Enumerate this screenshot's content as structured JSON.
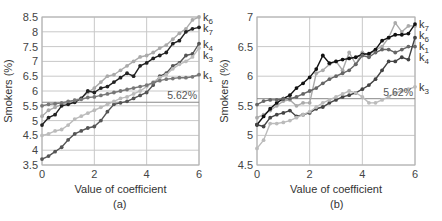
{
  "figure": {
    "panels": [
      {
        "caption": "(a)"
      },
      {
        "caption": "(b)"
      }
    ]
  },
  "chart_data": [
    {
      "type": "line",
      "caption": "(a)",
      "title": "",
      "xlabel": "Value of coefficient",
      "ylabel": "Smokers (%)",
      "xlim": [
        0,
        6
      ],
      "ylim": [
        3.5,
        8.5
      ],
      "xticks": [
        0,
        2,
        4,
        6
      ],
      "yticks": [
        3.5,
        4,
        4.5,
        5,
        5.5,
        6,
        6.5,
        7,
        7.5,
        8,
        8.5
      ],
      "ytick_labels": [
        "3.5",
        "4",
        "4.5",
        "5",
        "5.5",
        "6",
        "6.5",
        "7",
        "7.5",
        "8",
        "8.5"
      ],
      "grid": true,
      "reference_line": {
        "y": 5.62,
        "label": "5.62%"
      },
      "legend_position": "right-end labels",
      "x": [
        0,
        0.25,
        0.5,
        0.75,
        1.0,
        1.25,
        1.5,
        1.75,
        2.0,
        2.25,
        2.5,
        2.75,
        3.0,
        3.25,
        3.5,
        3.75,
        4.0,
        4.25,
        4.5,
        4.75,
        5.0,
        5.25,
        5.5,
        5.75,
        6.0
      ],
      "series": [
        {
          "name": "k6",
          "label_main": "k",
          "label_sub": "6",
          "color": "#aaaaaa",
          "marker_color": "#aaaaaa",
          "values": [
            5.15,
            5.35,
            5.45,
            5.55,
            5.62,
            5.7,
            5.75,
            5.95,
            6.1,
            6.3,
            6.5,
            6.55,
            6.7,
            6.85,
            7.0,
            7.15,
            7.2,
            7.3,
            7.45,
            7.55,
            7.75,
            7.95,
            8.1,
            8.4,
            8.5
          ]
        },
        {
          "name": "k7",
          "label_main": "k",
          "label_sub": "7",
          "color": "#222222",
          "marker_color": "#222222",
          "values": [
            4.85,
            5.1,
            5.2,
            5.5,
            5.55,
            5.62,
            5.75,
            6.0,
            5.95,
            6.1,
            6.15,
            6.3,
            6.45,
            6.6,
            6.5,
            6.85,
            6.95,
            7.1,
            7.2,
            7.3,
            7.6,
            7.7,
            8.0,
            8.1,
            8.15
          ]
        },
        {
          "name": "k4",
          "label_main": "k",
          "label_sub": "4",
          "color": "#555555",
          "marker_color": "#555555",
          "values": [
            3.7,
            3.8,
            3.95,
            4.1,
            4.35,
            4.55,
            4.65,
            4.75,
            4.8,
            5.0,
            5.3,
            5.55,
            5.6,
            5.65,
            5.75,
            5.85,
            5.95,
            6.2,
            6.5,
            6.6,
            6.85,
            6.95,
            7.2,
            7.25,
            7.6
          ]
        },
        {
          "name": "k3",
          "label_main": "k",
          "label_sub": "3",
          "color": "#bbbbbb",
          "marker_color": "#bbbbbb",
          "values": [
            4.5,
            4.55,
            4.65,
            4.7,
            4.85,
            5.05,
            5.15,
            5.25,
            5.35,
            5.45,
            5.55,
            5.65,
            5.75,
            5.8,
            5.9,
            6.0,
            6.15,
            6.3,
            6.45,
            6.55,
            6.75,
            6.9,
            7.0,
            7.15,
            7.45
          ]
        },
        {
          "name": "k1",
          "label_main": "k",
          "label_sub": "1",
          "color": "#777777",
          "marker_color": "#777777",
          "values": [
            5.5,
            5.55,
            5.57,
            5.6,
            5.65,
            5.68,
            5.72,
            5.78,
            5.8,
            5.85,
            5.9,
            5.95,
            6.0,
            6.05,
            6.1,
            6.15,
            6.2,
            6.28,
            6.35,
            6.4,
            6.42,
            6.45,
            6.45,
            6.48,
            6.55
          ]
        }
      ]
    },
    {
      "type": "line",
      "caption": "(b)",
      "title": "",
      "xlabel": "Value of coefficient",
      "ylabel": "Smokers (%)",
      "xlim": [
        0,
        6
      ],
      "ylim": [
        4.5,
        7
      ],
      "xticks": [
        0,
        2,
        4,
        6
      ],
      "yticks": [
        4.5,
        5,
        5.5,
        6,
        6.5,
        7
      ],
      "ytick_labels": [
        "4.5",
        "5",
        "5.5",
        "6",
        "6.5",
        "7"
      ],
      "grid": true,
      "reference_line": {
        "y": 5.62,
        "label": "5.62%"
      },
      "legend_position": "right-end labels",
      "x": [
        0,
        0.25,
        0.5,
        0.75,
        1.0,
        1.25,
        1.5,
        1.75,
        2.0,
        2.25,
        2.5,
        2.75,
        3.0,
        3.25,
        3.5,
        3.75,
        4.0,
        4.25,
        4.5,
        4.75,
        5.0,
        5.25,
        5.5,
        5.75,
        6.0
      ],
      "series": [
        {
          "name": "k6",
          "label_main": "k",
          "label_sub": "6",
          "color": "#aaaaaa",
          "marker_color": "#aaaaaa",
          "values": [
            5.3,
            5.35,
            5.42,
            5.5,
            5.58,
            5.6,
            5.5,
            5.55,
            5.55,
            6.05,
            6.1,
            6.2,
            6.25,
            6.1,
            6.4,
            6.2,
            6.4,
            6.35,
            6.45,
            6.5,
            6.65,
            6.9,
            6.75,
            6.85,
            6.85
          ]
        },
        {
          "name": "k7",
          "label_main": "k",
          "label_sub": "7",
          "color": "#111111",
          "marker_color": "#111111",
          "values": [
            5.18,
            5.32,
            5.45,
            5.55,
            5.62,
            5.68,
            5.8,
            5.88,
            5.98,
            6.12,
            6.35,
            6.22,
            6.25,
            6.28,
            6.3,
            6.32,
            6.37,
            6.38,
            6.45,
            6.6,
            6.65,
            6.7,
            6.7,
            6.72,
            6.88
          ]
        },
        {
          "name": "k4",
          "label_main": "k",
          "label_sub": "4",
          "color": "#666666",
          "marker_color": "#666666",
          "values": [
            5.52,
            5.58,
            5.6,
            5.6,
            5.62,
            5.62,
            5.65,
            5.7,
            5.75,
            5.8,
            5.88,
            5.95,
            6.0,
            6.05,
            6.1,
            6.2,
            6.35,
            6.32,
            6.4,
            6.45,
            6.45,
            6.4,
            6.45,
            6.5,
            6.5
          ]
        },
        {
          "name": "k1",
          "label_main": "k",
          "label_sub": "1",
          "color": "#444444",
          "marker_color": "#444444",
          "values": [
            5.18,
            5.15,
            5.3,
            5.35,
            5.38,
            5.42,
            5.32,
            5.35,
            5.38,
            5.45,
            5.48,
            5.55,
            5.6,
            5.65,
            5.68,
            5.72,
            5.78,
            5.85,
            5.95,
            6.1,
            6.25,
            6.25,
            6.32,
            6.28,
            6.65
          ]
        },
        {
          "name": "k3",
          "label_main": "k",
          "label_sub": "3",
          "color": "#bbbbbb",
          "marker_color": "#bbbbbb",
          "values": [
            4.78,
            4.92,
            5.2,
            5.2,
            5.22,
            5.25,
            5.3,
            5.35,
            5.4,
            5.48,
            5.55,
            5.6,
            5.65,
            5.7,
            5.75,
            5.72,
            5.65,
            5.55,
            5.55,
            5.6,
            5.65,
            5.72,
            5.75,
            5.78,
            5.82
          ]
        }
      ]
    }
  ]
}
